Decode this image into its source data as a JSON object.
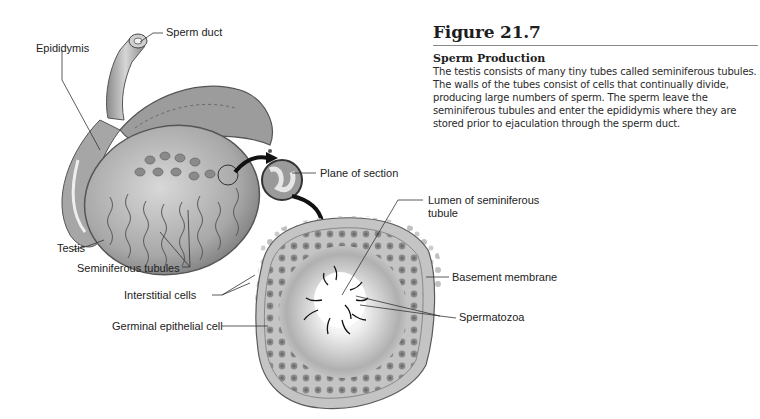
{
  "figure": {
    "number": "Figure 21.7",
    "subtitle": "Sperm Production",
    "caption": "The testis consists of many tiny tubes called seminiferous tubules. The walls of the tubes consist of cells that continually divide, producing large numbers of sperm. The sperm leave the seminiferous tubules and enter the epididymis where they are stored prior to ejaculation through the sperm duct."
  },
  "labels": {
    "sperm_duct": "Sperm duct",
    "epididymis": "Epididymis",
    "testis": "Testis",
    "seminiferous_tubules": "Seminiferous tubules",
    "plane_of_section": "Plane of section",
    "lumen_line1": "Lumen of seminiferous",
    "lumen_line2": "tubule",
    "basement_membrane": "Basement membrane",
    "interstitial_cells": "Interstitial cells",
    "spermatozoa": "Spermatozoa",
    "germinal_epithelial_cell": "Germinal epithelial cell"
  },
  "colors": {
    "ink": "#222222",
    "tissue_light": "#cfcfcf",
    "tissue_mid": "#9a9a9a",
    "tissue_dark": "#555555"
  }
}
